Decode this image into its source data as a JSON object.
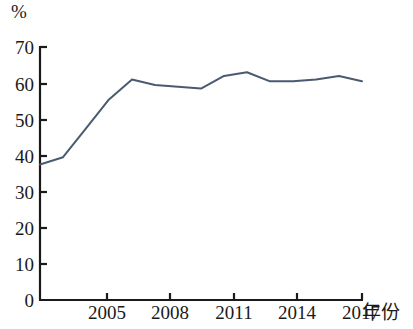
{
  "chart_data": {
    "type": "line",
    "title": "",
    "subtitle": "",
    "xlabel": "年份",
    "ylabel": "%",
    "ylim": [
      0,
      70
    ],
    "xlim": [
      2004,
      2018
    ],
    "grid": false,
    "legend": null,
    "y_ticks": [
      70,
      60,
      50,
      40,
      30,
      20,
      10,
      0
    ],
    "x_ticks": [
      2005,
      2008,
      2011,
      2014,
      2017
    ],
    "line_color": "#4a5a70",
    "series": [
      {
        "name": "",
        "x": [
          2004,
          2005,
          2006,
          2007,
          2008,
          2009,
          2010,
          2011,
          2012,
          2013,
          2014,
          2015,
          2016,
          2017,
          2018
        ],
        "values": [
          37.5,
          39.5,
          47.5,
          55.5,
          61.0,
          59.5,
          59.0,
          58.5,
          62.0,
          63.0,
          60.5,
          60.5,
          61.0,
          62.0,
          60.5
        ]
      }
    ]
  },
  "axes": {
    "unit_label": "%",
    "x_title": "年份",
    "y_tick_labels": [
      "70",
      "60",
      "50",
      "40",
      "30",
      "20",
      "10",
      "0"
    ],
    "x_tick_labels": [
      "2005",
      "2008",
      "2011",
      "2014",
      "2017"
    ]
  }
}
